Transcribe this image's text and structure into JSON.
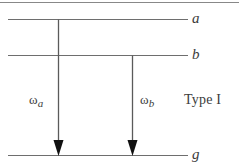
{
  "figure": {
    "kind": "energy-level-diagram",
    "caption_text": "Type I",
    "background_color": "#ffffff",
    "line_color": "#6e6e6e",
    "arrow_color": "#5a5a5a",
    "arrowhead_color": "#111111",
    "text_color": "#3b3b3b"
  },
  "border": {
    "top_rule": "top-border-rule"
  },
  "levels": [
    {
      "id": "a",
      "label": "a",
      "y": 19,
      "x1": 8,
      "x2": 188
    },
    {
      "id": "b",
      "label": "b",
      "y": 55,
      "x1": 8,
      "x2": 188
    },
    {
      "id": "g",
      "label": "g",
      "y": 155,
      "x1": 8,
      "x2": 188
    }
  ],
  "transitions": [
    {
      "id": "omega-a",
      "omega": "ω",
      "subscript": "a",
      "from_level": "a",
      "to_level": "g",
      "x": 58,
      "y_start": 19,
      "y_end": 155
    },
    {
      "id": "omega-b",
      "omega": "ω",
      "subscript": "b",
      "from_level": "b",
      "to_level": "g",
      "x": 132,
      "y_start": 55,
      "y_end": 155
    }
  ],
  "annotations": {
    "type_label": "Type I"
  }
}
